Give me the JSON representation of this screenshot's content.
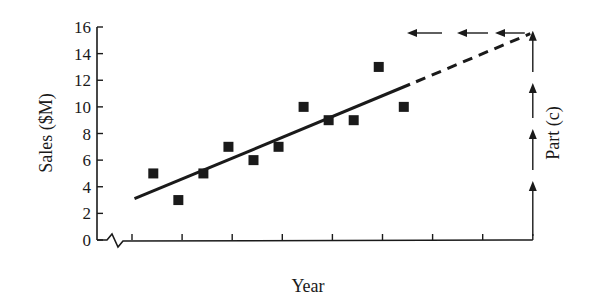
{
  "chart_data": {
    "type": "scatter",
    "title": "",
    "xlabel": "Year",
    "ylabel": "Sales ($M)",
    "right_annotation": "Part (c)",
    "ylim": [
      0,
      16
    ],
    "yticks": [
      0,
      2,
      4,
      6,
      8,
      10,
      12,
      14,
      16
    ],
    "ytick_labels": [
      "0",
      "2",
      "4",
      "6",
      "8",
      "10",
      "12",
      "14",
      "16"
    ],
    "x_axis_break": true,
    "x_tick_count": 9,
    "grid": false,
    "legend": null,
    "series": [
      {
        "name": "Sales data",
        "marker": "square",
        "x": [
          1,
          2,
          3,
          4,
          5,
          6,
          7,
          8,
          9,
          10,
          11
        ],
        "values": [
          5,
          3,
          5,
          7,
          6,
          7,
          10,
          9,
          9,
          13,
          10
        ]
      }
    ],
    "trend_line": {
      "style": "solid",
      "start": {
        "x": 0.1,
        "y": 3.1
      },
      "end": {
        "x": 11.1,
        "y": 11.7
      }
    },
    "extrapolation": {
      "style": "dashed",
      "start": {
        "x": 11.1,
        "y": 11.7
      },
      "end": {
        "x": 15.9,
        "y": 15.5
      }
    },
    "annotation_arrows": {
      "vertical_up_count": 4,
      "horizontal_left_count": 3,
      "reads_value": 15.5
    }
  },
  "colors": {
    "ink": "#1a1a1a",
    "background": "#ffffff"
  }
}
